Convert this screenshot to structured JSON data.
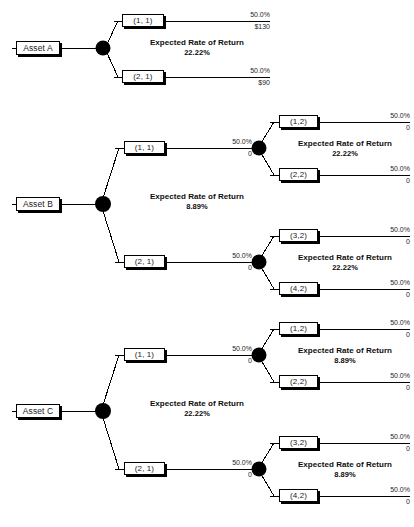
{
  "diagram": {
    "type": "decision-tree",
    "labels": {
      "expected_rate_of_return": "Expected Rate of Return"
    },
    "colors": {
      "line": "#000000",
      "node_fill": "#000000",
      "box_border": "#000000",
      "box_fill": "#ffffff",
      "text": "#1a1a1a",
      "background": "#ffffff"
    }
  },
  "trees": [
    {
      "id": "asset-a",
      "root_label": "Asset A",
      "root_err_title": "Expected Rate of Return",
      "root_err_value": "22.22%",
      "branches": [
        {
          "id": "a-1-1",
          "label": "(1, 1)",
          "terminal_probability": "50.0%",
          "terminal_payoff": "$130"
        },
        {
          "id": "a-2-1",
          "label": "(2, 1)",
          "terminal_probability": "50.0%",
          "terminal_payoff": "$90"
        }
      ]
    },
    {
      "id": "asset-b",
      "root_label": "Asset B",
      "root_err_title": "Expected Rate of Return",
      "root_err_value": "8.89%",
      "branches": [
        {
          "id": "b-1-1",
          "label": "(1, 1)",
          "branch_probability": "50.0%",
          "branch_payoff": "0",
          "err_title": "Expected Rate of Return",
          "err_value": "22.22%",
          "children": [
            {
              "id": "b-1-2",
              "label": "(1,2)",
              "terminal_probability": "50.0%",
              "terminal_payoff": "0"
            },
            {
              "id": "b-2-2",
              "label": "(2,2)",
              "terminal_probability": "50.0%",
              "terminal_payoff": "0"
            }
          ]
        },
        {
          "id": "b-2-1",
          "label": "(2, 1)",
          "branch_probability": "50.0%",
          "branch_payoff": "0",
          "err_title": "Expected Rate of Return",
          "err_value": "22.22%",
          "children": [
            {
              "id": "b-3-2",
              "label": "(3,2)",
              "terminal_probability": "50.0%",
              "terminal_payoff": "0"
            },
            {
              "id": "b-4-2",
              "label": "(4,2)",
              "terminal_probability": "50.0%",
              "terminal_payoff": "0"
            }
          ]
        }
      ]
    },
    {
      "id": "asset-c",
      "root_label": "Asset C",
      "root_err_title": "Expected Rate of Return",
      "root_err_value": "22.22%",
      "branches": [
        {
          "id": "c-1-1",
          "label": "(1, 1)",
          "branch_probability": "50.0%",
          "branch_payoff": "0",
          "err_title": "Expected Rate of Return",
          "err_value": "8.89%",
          "children": [
            {
              "id": "c-1-2",
              "label": "(1,2)",
              "terminal_probability": "50.0%",
              "terminal_payoff": "0"
            },
            {
              "id": "c-2-2",
              "label": "(2,2)",
              "terminal_probability": "50.0%",
              "terminal_payoff": "0"
            }
          ]
        },
        {
          "id": "c-2-1",
          "label": "(2, 1)",
          "branch_probability": "50.0%",
          "branch_payoff": "0",
          "err_title": "Expected Rate of Return",
          "err_value": "8.89%",
          "children": [
            {
              "id": "c-3-2",
              "label": "(3,2)",
              "terminal_probability": "50.0%",
              "terminal_payoff": "0"
            },
            {
              "id": "c-4-2",
              "label": "(4,2)",
              "terminal_probability": "50.0%",
              "terminal_payoff": "0"
            }
          ]
        }
      ]
    }
  ]
}
